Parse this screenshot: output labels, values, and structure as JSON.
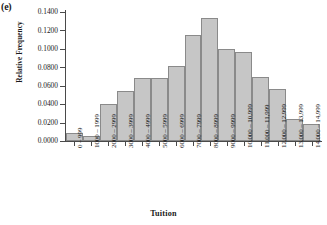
{
  "panel": {
    "letter": "(e)"
  },
  "chart_data": {
    "type": "bar",
    "title": "",
    "subtitle": "",
    "xlabel": "Tuition",
    "ylabel": "Relative Frequency",
    "grid": false,
    "legend": "none",
    "ylim": [
      0.0,
      0.14
    ],
    "ytick_labels": [
      "0.1400",
      "0.1200",
      "0.1000",
      "0.0800",
      "0.0600",
      "0.0400",
      "0.0200",
      "0.0000"
    ],
    "ytick_values": [
      0.14,
      0.12,
      0.1,
      0.08,
      0.06,
      0.04,
      0.02,
      0.0
    ],
    "categories": [
      "0 – 999",
      "1000 – 1999",
      "2000 – 2999",
      "3000 – 3999",
      "4000 – 4999",
      "5000 – 5999",
      "6000 – 6999",
      "7000 – 7999",
      "8000 – 8999",
      "9000 – 9999",
      "10,000 – 10,999",
      "11,000 – 11,999",
      "12,000 – 12,999",
      "13,000 – 13,999",
      "14,000 – 14,999"
    ],
    "values": [
      0.0085,
      0.0055,
      0.04,
      0.054,
      0.0685,
      0.0685,
      0.0815,
      0.115,
      0.1335,
      0.1,
      0.0965,
      0.0695,
      0.0565,
      0.024,
      0.0185
    ],
    "bar_fill_color": "#c6c6c6",
    "bar_edge_color": "#8a8a8a",
    "axis_color": "#4a4a4a"
  }
}
